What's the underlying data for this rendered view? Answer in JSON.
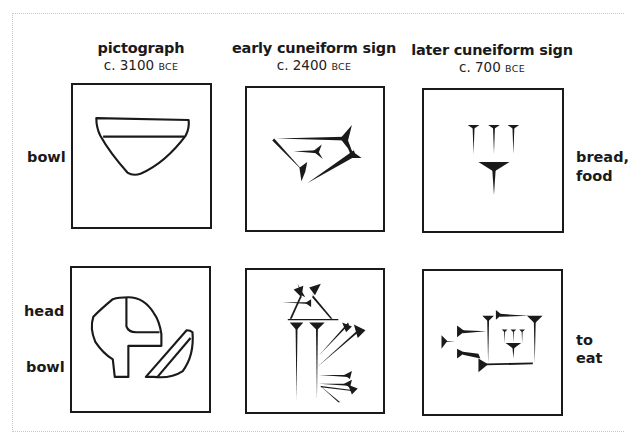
{
  "columns": [
    {
      "title": "pictograph",
      "date_prefix": "c. 3100",
      "era": "BCE"
    },
    {
      "title": "early cuneiform sign",
      "date_prefix": "c. 2400",
      "era": "BCE"
    },
    {
      "title": "later cuneiform sign",
      "date_prefix": "c. 700",
      "era": "BCE"
    }
  ],
  "rows": [
    {
      "left_labels": [
        "bowl"
      ],
      "right_labels": [
        "bread,",
        "food"
      ],
      "cells": [
        {
          "icon": "pictograph-bowl-icon"
        },
        {
          "icon": "early-cuneiform-bowl-icon"
        },
        {
          "icon": "later-cuneiform-bread-food-icon"
        }
      ]
    },
    {
      "left_labels": [
        "head",
        "bowl"
      ],
      "right_labels": [
        "to",
        "eat"
      ],
      "cells": [
        {
          "icon": "pictograph-head-bowl-icon"
        },
        {
          "icon": "early-cuneiform-eat-icon"
        },
        {
          "icon": "later-cuneiform-eat-icon"
        }
      ]
    }
  ],
  "colors": {
    "ink": "#1a1a1a",
    "frame": "#c9c9c9",
    "background": "#ffffff"
  }
}
